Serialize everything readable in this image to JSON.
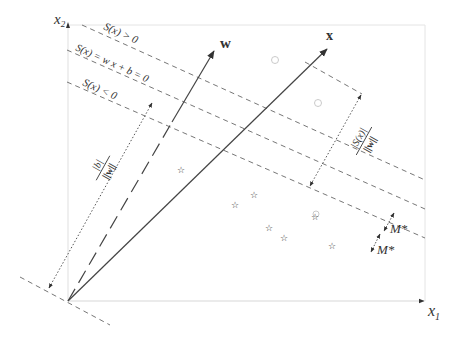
{
  "figure": {
    "type": "svm-hyperplane-geometry",
    "axes": {
      "x1_label": "x",
      "x1_sub": "1",
      "x2_label": "x",
      "x2_sub": "2"
    },
    "vectors": {
      "w_label": "w",
      "x_label": "x"
    },
    "hyperplanes": {
      "positive": "S(x) > 0",
      "zero": "S(x) = w x + b = 0",
      "negative": "S(x) < 0"
    },
    "distances": {
      "bias_numerator": "|b|",
      "bias_denominator": "||w||",
      "point_numerator": "|S(x)|",
      "point_denominator": "||w||",
      "margin_upper": "M*",
      "margin_lower": "M*"
    },
    "samples": {
      "class_positive_marker": "circle",
      "class_negative_marker": "star",
      "positive_points": [
        [
          275,
          60
        ],
        [
          318,
          103
        ],
        [
          316,
          214
        ]
      ],
      "negative_points": [
        [
          181,
          169
        ],
        [
          235,
          204
        ],
        [
          269,
          227
        ],
        [
          284,
          237
        ],
        [
          332,
          245
        ],
        [
          351,
          240
        ],
        [
          254,
          195
        ]
      ]
    },
    "colors": {
      "ink": "#333333",
      "dash": "#777777",
      "frame": "#dddddd",
      "marker": "#bbbbbb"
    }
  }
}
